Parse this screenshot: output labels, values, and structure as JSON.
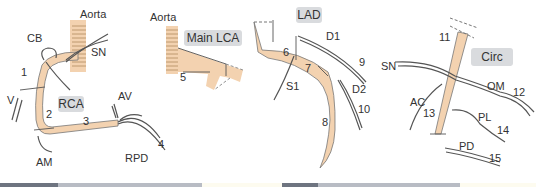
{
  "colors": {
    "vessel_fill": "#f3d2b0",
    "outline": "#555555",
    "tag_bg": "#d9dbde",
    "strip_dark": "#6e7480",
    "strip_light": "#b8bcc4",
    "strip_cream": "#fdfbef"
  },
  "panels": [
    {
      "id": "rca",
      "tag": "RCA",
      "labels": {
        "aorta": "Aorta",
        "cb": "CB",
        "sn": "SN",
        "seg1": "1",
        "v": "V",
        "seg2": "2",
        "seg3": "3",
        "av": "AV",
        "am": "AM",
        "rpd": "RPD",
        "seg4": "4"
      }
    },
    {
      "id": "lca",
      "tag": "Main LCA",
      "labels": {
        "aorta": "Aorta",
        "seg5": "5"
      }
    },
    {
      "id": "lad",
      "tag": "LAD",
      "labels": {
        "d1": "D1",
        "seg6": "6",
        "seg7": "7",
        "s1": "S1",
        "seg9": "9",
        "d2": "D2",
        "seg10": "10",
        "seg8": "8"
      }
    },
    {
      "id": "circ",
      "tag": "Circ",
      "labels": {
        "seg11": "11",
        "sn": "SN",
        "om": "OM",
        "seg12": "12",
        "ac": "AC",
        "seg13": "13",
        "pl": "PL",
        "seg14": "14",
        "pd": "PD",
        "seg15": "15"
      }
    }
  ]
}
